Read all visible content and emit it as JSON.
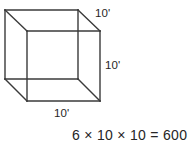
{
  "figure": {
    "shape": "cube",
    "stroke_color": "#3a3a3a",
    "background_color": "#ffffff",
    "text_color": "#262626",
    "labels": {
      "depth": "10'",
      "height": "10'",
      "width": "10'"
    },
    "equation": "6 × 10 × 10 = 600",
    "equation_parts": {
      "faces": "6",
      "operator_1": "×",
      "edge_a": "10",
      "operator_2": "×",
      "edge_b": "10",
      "equals": "=",
      "result": "600"
    },
    "geometry": {
      "back_face": {
        "x": 5,
        "y": 10,
        "size": 73
      },
      "front_face": {
        "x": 27,
        "y": 31,
        "size": 73
      },
      "offset_x": 22,
      "offset_y": 21
    }
  }
}
